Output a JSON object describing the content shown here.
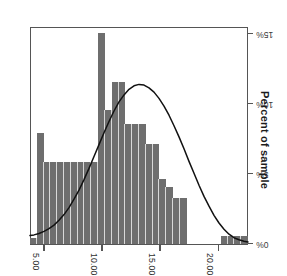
{
  "chart_data": {
    "type": "bar",
    "title": "",
    "subtitle": "",
    "xlabel": "",
    "ylabel": "Percent of sample",
    "orientation": "rotated-180",
    "grid": false,
    "legend": null,
    "xlim": [
      22.5,
      3.75
    ],
    "ylim": [
      0,
      15.5
    ],
    "x_tick_labels": [
      "20.00",
      "15.00",
      "10.00",
      "5.00"
    ],
    "x_tick_values": [
      20.0,
      15.0,
      10.0,
      5.0
    ],
    "y_tick_labels": [
      "0%",
      "5%",
      "10%",
      "15%"
    ],
    "y_tick_values": [
      0,
      5,
      10,
      15
    ],
    "bar_color": "#6e6e6e",
    "bar_separator_color": "#d8d8d8",
    "axis_color": "#555555",
    "curve_color": "#111111",
    "categories": [
      "22.25",
      "21.50",
      "20.75",
      "20.25",
      "19.75",
      "19.25",
      "17.25",
      "16.75",
      "16.25",
      "15.75",
      "15.25",
      "14.75",
      "14.25",
      "13.75",
      "13.25",
      "12.75",
      "12.25",
      "11.75",
      "11.25",
      "10.75",
      "10.25",
      "9.75",
      "9.25",
      "8.75",
      "8.25",
      "7.75",
      "7.25",
      "6.75",
      "6.25",
      "5.75",
      "5.25",
      "4.75"
    ],
    "values": [
      0.55,
      0.55,
      0.55,
      0.55,
      0.0,
      0.0,
      0.0,
      0.0,
      0.0,
      3.3,
      3.3,
      4.05,
      4.65,
      7.15,
      7.15,
      8.55,
      8.55,
      8.55,
      11.55,
      11.55,
      9.6,
      15.05,
      5.85,
      5.85,
      5.85,
      5.85,
      5.85,
      5.85,
      5.85,
      5.85,
      7.9,
      0.45
    ],
    "curve_label": "normal distribution fit",
    "curve_points": [
      [
        0,
        0.15
      ],
      [
        4,
        0.2
      ],
      [
        9,
        0.3
      ],
      [
        14,
        0.45
      ],
      [
        19,
        0.7
      ],
      [
        24,
        1.05
      ],
      [
        29,
        1.5
      ],
      [
        34,
        2.05
      ],
      [
        39,
        2.7
      ],
      [
        44,
        3.4
      ],
      [
        49,
        4.2
      ],
      [
        54,
        5.05
      ],
      [
        59,
        5.9
      ],
      [
        64,
        6.8
      ],
      [
        69,
        7.65
      ],
      [
        74,
        8.45
      ],
      [
        79,
        9.2
      ],
      [
        84,
        9.85
      ],
      [
        89,
        10.4
      ],
      [
        94,
        10.85
      ],
      [
        99,
        11.15
      ],
      [
        104,
        11.35
      ],
      [
        109,
        11.4
      ],
      [
        114,
        11.3
      ],
      [
        119,
        11.05
      ],
      [
        124,
        10.65
      ],
      [
        129,
        10.15
      ],
      [
        134,
        9.5
      ],
      [
        139,
        8.75
      ],
      [
        144,
        7.95
      ],
      [
        149,
        7.1
      ],
      [
        154,
        6.25
      ],
      [
        159,
        5.4
      ],
      [
        164,
        4.6
      ],
      [
        169,
        3.85
      ],
      [
        174,
        3.2
      ],
      [
        179,
        2.6
      ],
      [
        184,
        2.1
      ],
      [
        189,
        1.7
      ],
      [
        194,
        1.35
      ],
      [
        199,
        1.1
      ],
      [
        204,
        0.9
      ],
      [
        209,
        0.75
      ],
      [
        214,
        0.65
      ],
      [
        218,
        0.6
      ]
    ]
  },
  "axis": {
    "value_axis_title": "Percent of sample"
  }
}
